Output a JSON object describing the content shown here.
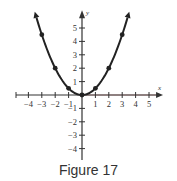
{
  "caption": "Figure 17",
  "chart_data": {
    "type": "line",
    "title": "",
    "function": "y = x^2 / 2",
    "xlabel": "x",
    "ylabel": "y",
    "xlim": [
      -5,
      5.5
    ],
    "ylim": [
      -5,
      6
    ],
    "x_ticks": [
      -4,
      -3,
      -2,
      -1,
      1,
      2,
      3,
      4,
      5
    ],
    "y_ticks": [
      -4,
      -3,
      -2,
      -1,
      1,
      2,
      3,
      4,
      5
    ],
    "x_tick_labels": [
      "−4",
      "−3",
      "−2",
      "−1",
      "1",
      "2",
      "3",
      "4",
      "5"
    ],
    "y_tick_labels": [
      "−4",
      "−3",
      "−2",
      "−1",
      "1",
      "2",
      "3",
      "4",
      "5"
    ],
    "grid": false,
    "legend": null,
    "series": [
      {
        "name": "parabola",
        "points": [
          {
            "x": -3,
            "y": 4.5
          },
          {
            "x": -2,
            "y": 2
          },
          {
            "x": -1,
            "y": 0.5
          },
          {
            "x": 0,
            "y": 0
          },
          {
            "x": 1,
            "y": 0.5
          },
          {
            "x": 2,
            "y": 2
          },
          {
            "x": 3,
            "y": 4.5
          }
        ],
        "curve_extends_to_x": [
          -3.4,
          3.4
        ],
        "arrows_at_ends": true,
        "color": "#222222"
      }
    ],
    "colors": {
      "axis": "#333333",
      "curve": "#222222",
      "x_axis_right_tint": "#7a4a4a"
    }
  }
}
